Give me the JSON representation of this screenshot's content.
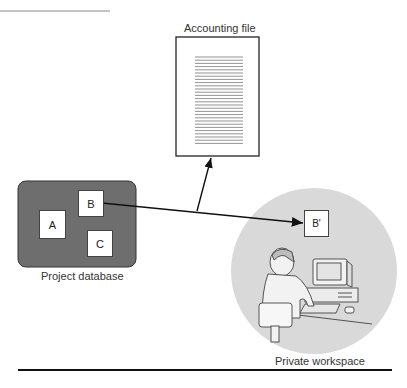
{
  "figure": {
    "accounting_file": {
      "label": "Accounting file",
      "line_count": 28
    },
    "project_database": {
      "label": "Project database",
      "items": [
        {
          "id": "A",
          "label": "A"
        },
        {
          "id": "B",
          "label": "B"
        },
        {
          "id": "C",
          "label": "C"
        }
      ]
    },
    "private_workspace": {
      "label": "Private workspace",
      "copy": {
        "label": "B'"
      },
      "illustration": "person-at-computer"
    },
    "connections": [
      {
        "from": "B",
        "to": "B'",
        "type": "arrow"
      },
      {
        "from": "junction",
        "to": "Accounting file",
        "type": "arrow"
      }
    ]
  },
  "colors": {
    "database_fill": "#6e6e6e",
    "workspace_fill": "#d9d9d9",
    "line": "#111111",
    "box_fill": "#ffffff"
  }
}
